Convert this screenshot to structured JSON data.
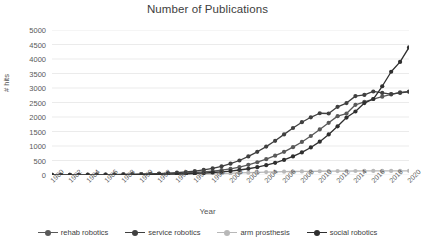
{
  "chart_data": {
    "type": "line",
    "title": "Number of Publications",
    "xlabel": "Year",
    "ylabel": "# hits",
    "ylim": [
      0,
      5000
    ],
    "ytick_step": 500,
    "yticks": [
      0,
      500,
      1000,
      1500,
      2000,
      2500,
      3000,
      3500,
      4000,
      4500,
      5000
    ],
    "ytick_labels": [
      "0",
      "500",
      "1000",
      "1500",
      "2000",
      "2500",
      "3000",
      "3500",
      "4000",
      "4500",
      "5000"
    ],
    "grid": true,
    "grid_axis": "y",
    "legend_position": "bottom",
    "x": [
      1980,
      1981,
      1982,
      1983,
      1984,
      1985,
      1986,
      1987,
      1988,
      1989,
      1990,
      1991,
      1992,
      1993,
      1994,
      1995,
      1996,
      1997,
      1998,
      1999,
      2000,
      2001,
      2002,
      2003,
      2004,
      2005,
      2006,
      2007,
      2008,
      2009,
      2010,
      2011,
      2012,
      2013,
      2014,
      2015,
      2016,
      2017,
      2018,
      2019,
      2020
    ],
    "xtick_labels": [
      "1980",
      "1982",
      "1984",
      "1986",
      "1988",
      "1990",
      "1992",
      "1994",
      "1996",
      "1998",
      "2000",
      "2002",
      "2004",
      "2006",
      "2008",
      "2010",
      "2012",
      "2014",
      "2016",
      "2018",
      "2020"
    ],
    "series": [
      {
        "name": "rehab robotics",
        "color": "#595959",
        "values": [
          5,
          6,
          8,
          9,
          10,
          12,
          14,
          16,
          20,
          24,
          28,
          33,
          40,
          48,
          58,
          70,
          86,
          105,
          130,
          165,
          210,
          275,
          350,
          440,
          545,
          665,
          800,
          960,
          1140,
          1345,
          1570,
          1800,
          2030,
          2120,
          2420,
          2520,
          2620,
          2700,
          2780,
          2850,
          2880
        ]
      },
      {
        "name": "service robotics",
        "color": "#404040",
        "values": [
          4,
          5,
          6,
          7,
          9,
          11,
          13,
          16,
          19,
          24,
          30,
          38,
          48,
          62,
          80,
          104,
          135,
          175,
          230,
          300,
          390,
          500,
          640,
          800,
          980,
          1180,
          1400,
          1620,
          1820,
          1990,
          2130,
          2120,
          2350,
          2480,
          2720,
          2760,
          2880,
          2830,
          2790,
          2830,
          2870
        ]
      },
      {
        "name": "arm prosthesis",
        "color": "#b8b8b8",
        "values": [
          3,
          3,
          4,
          4,
          5,
          5,
          6,
          7,
          8,
          9,
          10,
          12,
          14,
          17,
          20,
          24,
          29,
          35,
          42,
          50,
          60,
          70,
          80,
          90,
          100,
          108,
          115,
          120,
          124,
          128,
          130,
          132,
          134,
          136,
          138,
          139,
          140,
          141,
          142,
          143,
          144
        ]
      },
      {
        "name": "social robotics",
        "color": "#2f2f2f",
        "values": [
          2,
          2,
          3,
          3,
          4,
          5,
          6,
          7,
          9,
          11,
          14,
          17,
          22,
          27,
          34,
          43,
          54,
          68,
          86,
          108,
          136,
          172,
          215,
          270,
          340,
          420,
          520,
          640,
          780,
          950,
          1150,
          1400,
          1680,
          1980,
          2190,
          2480,
          2620,
          3060,
          3560,
          3900,
          4400
        ]
      }
    ]
  },
  "legend": {
    "items": [
      {
        "label": "rehab robotics"
      },
      {
        "label": "service robotics"
      },
      {
        "label": "arm prosthesis"
      },
      {
        "label": "social robotics"
      }
    ]
  }
}
